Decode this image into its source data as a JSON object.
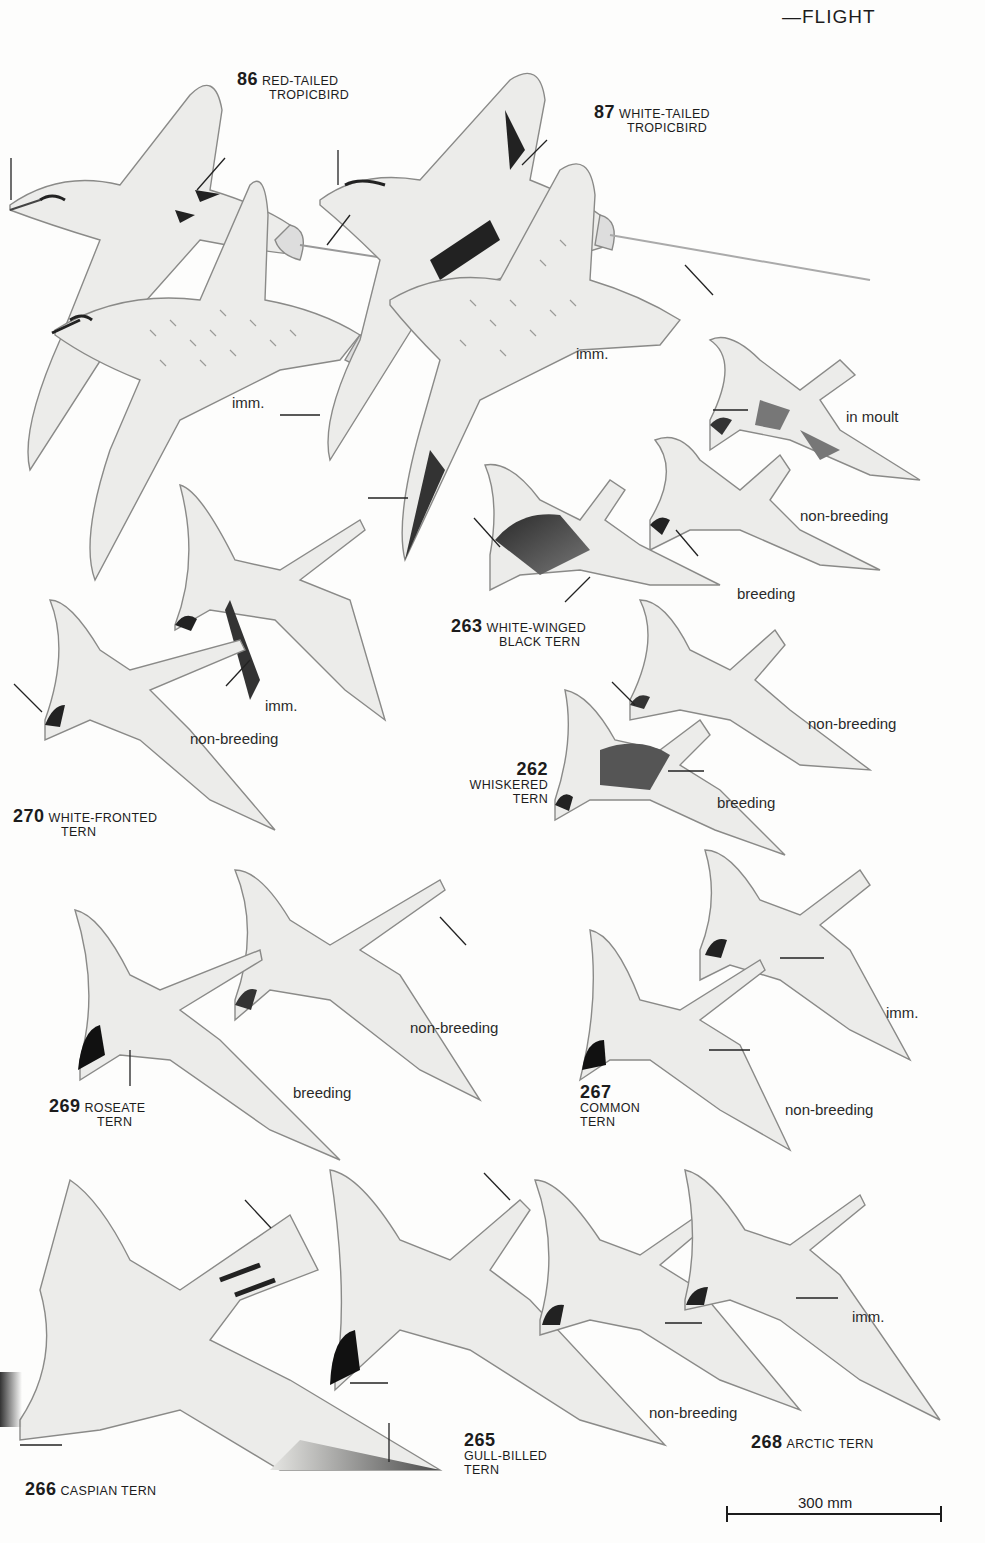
{
  "page": {
    "header_partial": "—FLIGHT",
    "colors": {
      "paper": "#fdfdfc",
      "ink": "#1c1c1c",
      "wing_grey": "#d9d9d6",
      "dark_cap": "#222222"
    }
  },
  "species": [
    {
      "number": "86",
      "name_line1": "RED-TAILED",
      "name_line2": "TROPICBIRD"
    },
    {
      "number": "87",
      "name_line1": "WHITE-TAILED",
      "name_line2": "TROPICBIRD"
    },
    {
      "number": "263",
      "name_line1": "WHITE-WINGED",
      "name_line2": "BLACK TERN"
    },
    {
      "number": "262",
      "name_line1": "WHISKERED",
      "name_line2": "TERN"
    },
    {
      "number": "270",
      "name_line1": "WHITE-FRONTED",
      "name_line2": "TERN"
    },
    {
      "number": "269",
      "name_line1": "ROSEATE",
      "name_line2": "TERN"
    },
    {
      "number": "267",
      "name_line1": "COMMON",
      "name_line2": "TERN"
    },
    {
      "number": "265",
      "name_line1": "GULL-BILLED",
      "name_line2": "TERN"
    },
    {
      "number": "268",
      "name_line1": "ARCTIC TERN",
      "name_line2": ""
    },
    {
      "number": "266",
      "name_line1": "CASPIAN TERN",
      "name_line2": ""
    }
  ],
  "plumage_notes": [
    {
      "id": "tropic86_imm",
      "text": "imm."
    },
    {
      "id": "tropic87_imm",
      "text": "imm."
    },
    {
      "id": "wwbt_moult",
      "text": "in moult"
    },
    {
      "id": "wwbt_nonbreeding",
      "text": "non-breeding"
    },
    {
      "id": "wwbt_breeding",
      "text": "breeding"
    },
    {
      "id": "wft_imm",
      "text": "imm."
    },
    {
      "id": "wft_nonbreeding",
      "text": "non-breeding"
    },
    {
      "id": "whisk_nonbreeding",
      "text": "non-breeding"
    },
    {
      "id": "whisk_breeding",
      "text": "breeding"
    },
    {
      "id": "roseate_nonbreeding",
      "text": "non-breeding"
    },
    {
      "id": "roseate_breeding",
      "text": "breeding"
    },
    {
      "id": "common_imm",
      "text": "imm."
    },
    {
      "id": "common_nonbreeding",
      "text": "non-breeding"
    },
    {
      "id": "arctic_nonbreeding",
      "text": "non-breeding"
    },
    {
      "id": "arctic_imm",
      "text": "imm."
    }
  ],
  "scale_bar": {
    "label": "300 mm"
  }
}
